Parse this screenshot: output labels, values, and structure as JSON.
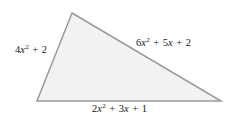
{
  "figure": {
    "name": "triangle-with-polynomial-side-lengths",
    "shape": "triangle",
    "background_color": "#ffffff",
    "fill_color": "#f2f2f2",
    "stroke_color": "#999999",
    "stroke_width": 1.5,
    "vertices": {
      "apex": {
        "x": 72,
        "y": 13
      },
      "bottom_left": {
        "x": 37,
        "y": 101
      },
      "bottom_right": {
        "x": 221,
        "y": 101
      }
    }
  },
  "labels": {
    "left_side": {
      "text": "4x2 + 2",
      "coefficient": "4",
      "variable": "x",
      "exponent": "2",
      "operator_1": "+",
      "constant": "2"
    },
    "hypotenuse": {
      "text": "6x2 + 5x + 2",
      "coefficient": "6",
      "variable": "x",
      "exponent": "2",
      "operator_1": "+",
      "linear_coefficient": "5",
      "linear_variable": "x",
      "operator_2": "+",
      "constant": "2"
    },
    "base": {
      "text": "2x2 + 3x + 1",
      "coefficient": "2",
      "variable": "x",
      "exponent": "2",
      "operator_1": "+",
      "linear_coefficient": "3",
      "linear_variable": "x",
      "operator_2": "+",
      "constant": "1"
    }
  }
}
